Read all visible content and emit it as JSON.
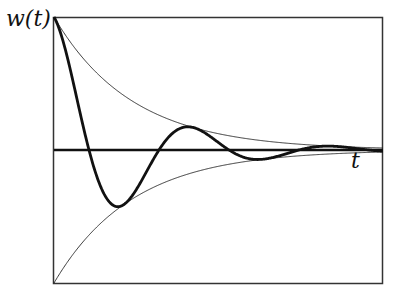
{
  "chart_data": {
    "type": "line",
    "title": "",
    "xlabel": "t",
    "ylabel": "w(t)",
    "grid": false,
    "legend": null,
    "series": [
      {
        "name": "w(t)",
        "style": "thick",
        "formula": "exp(-k t) * cos(omega t)"
      },
      {
        "name": "upper envelope",
        "style": "thin",
        "formula": "exp(-k t)"
      },
      {
        "name": "lower envelope",
        "style": "thin",
        "formula": "-exp(-k t)"
      },
      {
        "name": "t-axis",
        "style": "thick",
        "formula": "0"
      }
    ],
    "xlim": [
      0,
      1
    ],
    "ylim": [
      -1,
      1
    ]
  },
  "labels": {
    "y": "w(t)",
    "x": "t"
  },
  "colors": {
    "stroke": "#111111",
    "frame": "#333333",
    "background": "#ffffff"
  }
}
